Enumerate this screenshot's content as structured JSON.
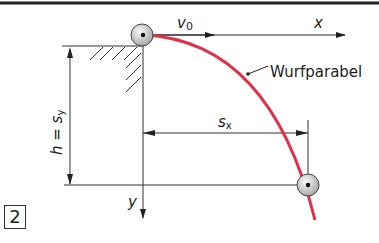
{
  "figure": {
    "number": "2",
    "labels": {
      "velocity": "v",
      "velocity_sub": "0",
      "x_axis": "x",
      "y_axis": "y",
      "curve_label": "Wurfparabel",
      "height": "h = s",
      "height_sub": "y",
      "distance": "s",
      "distance_sub": "x"
    },
    "colors": {
      "trajectory": "#e0304a",
      "lines": "#333333",
      "ball_fill": "#d8d8d8"
    }
  }
}
